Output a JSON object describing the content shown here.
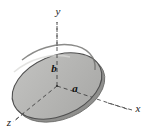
{
  "figure": {
    "background_color": "#ffffff",
    "disk": {
      "name": "elliptical-disk",
      "fill_color": "#b6b6b4",
      "edge_color": "#4a4a4a",
      "rim_color": "#8f8f8d",
      "highlight_color": "#d8d8d6",
      "center_x": 57,
      "center_y": 86,
      "radius_x": 47,
      "radius_y": 30,
      "rotation_deg": -23
    },
    "axes": [
      {
        "name": "y-axis",
        "label": "y",
        "label_x": 58,
        "label_y": 15,
        "direction": "up",
        "style": "dashed",
        "color": "#5a5a5a"
      },
      {
        "name": "x-axis",
        "label": "x",
        "label_x": 138,
        "label_y": 112,
        "direction": "lower-right",
        "style": "dashed",
        "color": "#5a5a5a"
      },
      {
        "name": "z-axis",
        "label": "z",
        "label_x": 9,
        "label_y": 126,
        "direction": "lower-left",
        "style": "dashed",
        "color": "#5a5a5a"
      }
    ],
    "dimensions": [
      {
        "name": "semi-minor-axis-b",
        "label": "b",
        "label_x": 54,
        "label_y": 72,
        "description": "semi-axis along y"
      },
      {
        "name": "semi-major-axis-a",
        "label": "a",
        "label_x": 75,
        "label_y": 92,
        "description": "semi-axis along x"
      }
    ],
    "origin": {
      "x": 57,
      "y": 86
    }
  }
}
